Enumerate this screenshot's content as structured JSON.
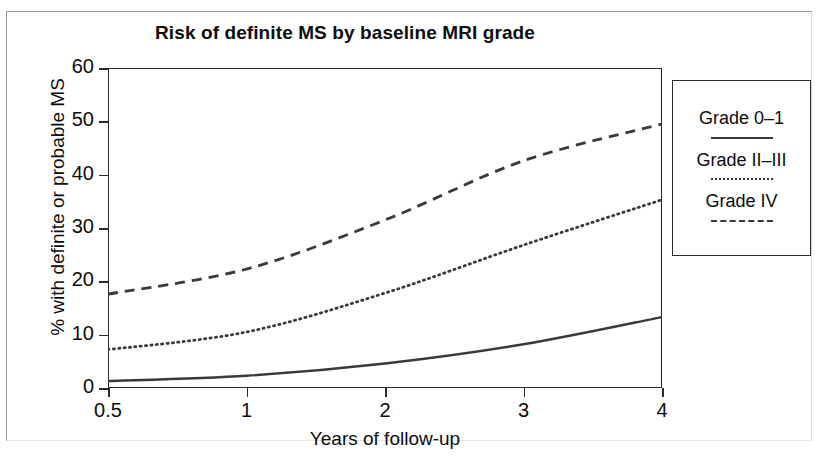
{
  "figure": {
    "title": "Risk of definite MS by baseline MRI grade"
  },
  "axes": {
    "x_label": "Years of follow-up",
    "y_label": "% with definite or probable MS"
  },
  "legend": {
    "entries": [
      {
        "label": "Grade 0–1",
        "style": "solid"
      },
      {
        "label": "Grade II–III",
        "style": "dotted"
      },
      {
        "label": "Grade IV",
        "style": "dashed"
      }
    ]
  },
  "chart_data": {
    "type": "line",
    "title": "Risk of definite MS by baseline MRI grade",
    "xlabel": "Years of follow-up",
    "ylabel": "% with definite or probable MS",
    "x": [
      0.5,
      1,
      2,
      3,
      4
    ],
    "xticklabels": [
      "0.5",
      "1",
      "2",
      "3",
      "4"
    ],
    "yticklabels": [
      "0",
      "10",
      "20",
      "30",
      "40",
      "50",
      "60"
    ],
    "ylim": [
      0,
      60
    ],
    "yticks": [
      0,
      10,
      20,
      30,
      40,
      50,
      60
    ],
    "x_scale": "non-linear (equal spacing between labelled years)",
    "grid": false,
    "legend_position": "right outside",
    "series": [
      {
        "name": "Grade 0–1",
        "style": "solid",
        "color": "#3a3a3a",
        "values": [
          1.3,
          2.3,
          4.6,
          8.2,
          13.3
        ]
      },
      {
        "name": "Grade II–III",
        "style": "dotted",
        "color": "#3a3a3a",
        "values": [
          7.2,
          10.5,
          17.8,
          26.8,
          35.3
        ]
      },
      {
        "name": "Grade IV",
        "style": "dashed",
        "color": "#3a3a3a",
        "values": [
          17.6,
          22.3,
          31.5,
          42.6,
          49.5
        ]
      }
    ]
  }
}
